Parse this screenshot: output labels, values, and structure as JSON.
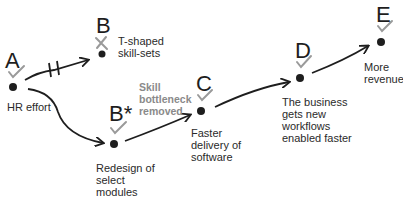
{
  "diagram": {
    "colors": {
      "ink": "#1e1e1e",
      "check": "#9a9a9a",
      "note": "#8a8a8a"
    },
    "nodes": [
      {
        "id": "A",
        "letter": "A",
        "label": "HR effort",
        "status": "check"
      },
      {
        "id": "B",
        "letter": "B",
        "label": "T-shaped\nskill-sets",
        "status": "cross"
      },
      {
        "id": "Bstar",
        "letter": "B*",
        "label": "Redesign of\nselect\nmodules",
        "status": "check"
      },
      {
        "id": "C",
        "letter": "C",
        "label": "Faster\ndelivery of\nsoftware",
        "status": "check"
      },
      {
        "id": "D",
        "letter": "D",
        "label": "The business\ngets new\nworkflows\nenabled faster",
        "status": "check"
      },
      {
        "id": "E",
        "letter": "E",
        "label": "More\nrevenue",
        "status": "check"
      }
    ],
    "edges": [
      {
        "from": "A",
        "to": "B",
        "type": "blocked"
      },
      {
        "from": "A",
        "to": "Bstar",
        "type": "arrow"
      },
      {
        "from": "Bstar",
        "to": "C",
        "type": "arrow"
      },
      {
        "from": "C",
        "to": "D",
        "type": "arrow"
      },
      {
        "from": "D",
        "to": "E",
        "type": "arrow"
      }
    ],
    "annotation": "Skill\nbottleneck\nremoved"
  }
}
